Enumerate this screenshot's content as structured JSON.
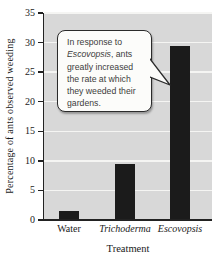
{
  "chart_data": {
    "type": "bar",
    "categories": [
      "Water",
      "Trichoderma",
      "Escovopsis"
    ],
    "categories_italic": [
      false,
      true,
      true
    ],
    "values": [
      1.5,
      9.5,
      29.5
    ],
    "title": "",
    "xlabel": "Treatment",
    "ylabel": "Percentage of ants observed weeding",
    "ylim": [
      0,
      35
    ],
    "yticks": [
      0,
      5,
      10,
      15,
      20,
      25,
      30,
      35
    ],
    "grid": "horizontal",
    "legend": "none",
    "colors": {
      "bar": "#1b1b1b",
      "plot_background": "#d8d8d8",
      "gridline": "#f5f5f3",
      "axis": "#222222",
      "page_background": "#ffffff",
      "callout_background": "#fcfcfa",
      "callout_border": "#2b2b2b",
      "text": "#1a1a1a"
    },
    "annotation": {
      "full_text": "In response to Escovopsis, ants greatly increased the rate at which they weeded their gardens.",
      "italic_word": "Escovopsis",
      "lines": [
        {
          "pre": "In response to",
          "italic": "",
          "post": ""
        },
        {
          "pre": "",
          "italic": "Escovopsis",
          "post": ", ants"
        },
        {
          "pre": "greatly increased",
          "italic": "",
          "post": ""
        },
        {
          "pre": "the rate at which",
          "italic": "",
          "post": ""
        },
        {
          "pre": "they weeded their",
          "italic": "",
          "post": ""
        },
        {
          "pre": "gardens.",
          "italic": "",
          "post": ""
        }
      ]
    }
  }
}
